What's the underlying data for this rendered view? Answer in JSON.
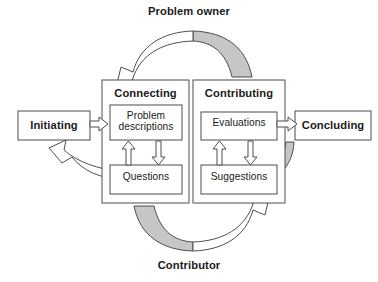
{
  "diagram": {
    "title_top": "Problem owner",
    "title_bottom": "Contributor",
    "stages": {
      "initiating": "Initiating",
      "connecting": "Connecting",
      "contributing": "Contributing",
      "concluding": "Concluding"
    },
    "inner_boxes": {
      "problem_descriptions": "Problem\ndescriptions",
      "questions": "Questions",
      "evaluations": "Evaluations",
      "suggestions": "Suggestions"
    },
    "colors": {
      "stroke": "#4d4d4d",
      "gray_fill": "#c6c6c6",
      "white_fill": "#ffffff",
      "text": "#1a1a1a",
      "background": "#ffffff"
    }
  }
}
